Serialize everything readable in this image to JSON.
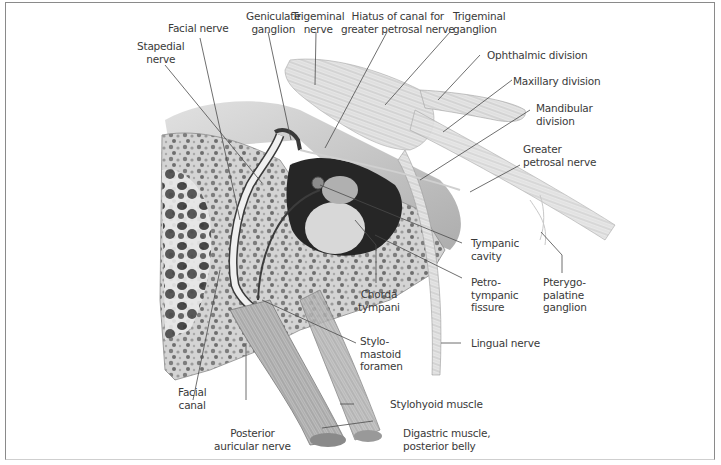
{
  "figure": {
    "colors": {
      "frame": "#8a8a8a",
      "label_text": "#3a3a3a",
      "leader_line": "#4a4a4a",
      "bone": "#d9d9d9",
      "nerve": "#ececec",
      "cavity": "#2a2a2a"
    }
  },
  "labels": {
    "facial_nerve": "Facial nerve",
    "geniculate_ganglion": "Geniculate\nganglion",
    "trigeminal_nerve": "Trigeminal\nnerve",
    "hiatus": "Hiatus of canal for\ngreater petrosal nerve",
    "trigeminal_ganglion": "Trigeminal\nganglion",
    "stapedial_nerve": "Stapedial\nnerve",
    "ophthalmic_division": "Ophthalmic division",
    "maxillary_division": "Maxillary division",
    "mandibular_division": "Mandibular\ndivision",
    "greater_petrosal_nerve": "Greater\npetrosal nerve",
    "tympanic_cavity": "Tympanic\ncavity",
    "petrotympanic_fissure": "Petro-\ntympanic\nfissure",
    "pterygopalatine_ganglion": "Pterygo-\npalatine\nganglion",
    "chorda_tympani": "Chorda\ntympani",
    "lingual_nerve": "Lingual nerve",
    "stylomastoid_foramen": "Stylo-\nmastoid\nforamen",
    "facial_canal": "Facial\ncanal",
    "stylohyoid_muscle": "Stylohyoid muscle",
    "posterior_auricular_nerve": "Posterior\nauricular nerve",
    "digastric_muscle": "Digastric muscle,\nposterior belly"
  }
}
